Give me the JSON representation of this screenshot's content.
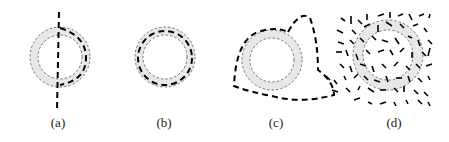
{
  "figure": {
    "panels": [
      {
        "id": "a",
        "label": "(a)",
        "description": "Ring with a straight vertical dashed line through the left side and a dashed arc along the right side of the ring band"
      },
      {
        "id": "b",
        "label": "(b)",
        "description": "Ring with dashed curve closely following the ring band"
      },
      {
        "id": "c",
        "label": "(c)",
        "description": "Ring with a dashed closed curve that follows the band and loops outside on the upper-right and lower-right"
      },
      {
        "id": "d",
        "label": "(d)",
        "description": "Ring surrounded and overlapped by many randomly oriented short line segments"
      }
    ],
    "colors": {
      "ring_band": "#e8e8e8",
      "ring_edge": "#555555",
      "curve": "#000000",
      "background": "#ffffff"
    }
  }
}
